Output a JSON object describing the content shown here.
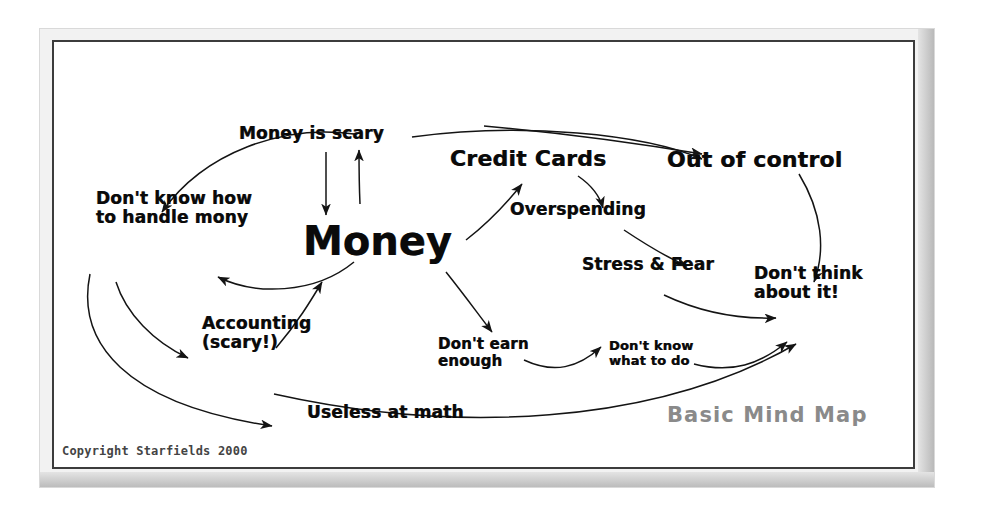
{
  "diagram": {
    "title_watermark": "Basic Mind Map",
    "copyright": "Copyright Starfields 2000",
    "ink_color": "#0a0a0a",
    "watermark_color": "#8a8a8a",
    "background_color": "#ffffff",
    "frame_color": "#3c3c3c"
  },
  "nodes": {
    "central": "Money",
    "money_is_scary": "Money is scary",
    "dont_know_handle": "Don't know how\nto handle mony",
    "credit_cards": "Credit Cards",
    "out_of_control": "Out of control",
    "overspending": "Overspending",
    "stress_and_fear": "Stress & Fear",
    "dont_think_about_it": "Don't think\nabout it!",
    "dont_earn_enough": "Don't earn\nenough",
    "dont_know_what_to_do": "Don't know\nwhat to do",
    "accounting": "Accounting\n(scary!)",
    "useless_at_math": "Useless at math"
  },
  "edges": [
    {
      "from": "money",
      "to": "money-is-scary",
      "style": "straight-arrow"
    },
    {
      "from": "money-is-scary",
      "to": "money",
      "style": "straight-arrow"
    },
    {
      "from": "money-is-scary",
      "to": "dont-know-how-to-handle-mony",
      "style": "long-arc"
    },
    {
      "from": "money-is-scary",
      "to": "out-of-control",
      "style": "long-arc"
    },
    {
      "from": "money",
      "to": "credit-cards",
      "style": "straight-arrow"
    },
    {
      "from": "credit-cards",
      "to": "overspending",
      "style": "curve-arrow"
    },
    {
      "from": "credit-cards",
      "to": "out-of-control",
      "style": "long-arc"
    },
    {
      "from": "overspending",
      "to": "stress-and-fear",
      "style": "curve-arrow"
    },
    {
      "from": "stress-and-fear",
      "to": "dont-think-about-it",
      "style": "curve-arrow"
    },
    {
      "from": "out-of-control",
      "to": "dont-think-about-it",
      "style": "curve-arrow"
    },
    {
      "from": "money",
      "to": "dont-earn-enough",
      "style": "straight-arrow"
    },
    {
      "from": "dont-earn-enough",
      "to": "dont-know-what-to-do",
      "style": "curve-arrow"
    },
    {
      "from": "dont-know-what-to-do",
      "to": "dont-think-about-it",
      "style": "curve-arrow"
    },
    {
      "from": "dont-know-how-to-handle-mony",
      "to": "money",
      "style": "curve-arrow"
    },
    {
      "from": "dont-know-how-to-handle-mony",
      "to": "accounting",
      "style": "curve-arrow"
    },
    {
      "from": "dont-know-how-to-handle-mony",
      "to": "useless-at-math",
      "style": "long-arc"
    },
    {
      "from": "accounting",
      "to": "money",
      "style": "straight-arrow"
    },
    {
      "from": "useless-at-math",
      "to": "dont-think-about-it",
      "style": "long-arc"
    }
  ]
}
